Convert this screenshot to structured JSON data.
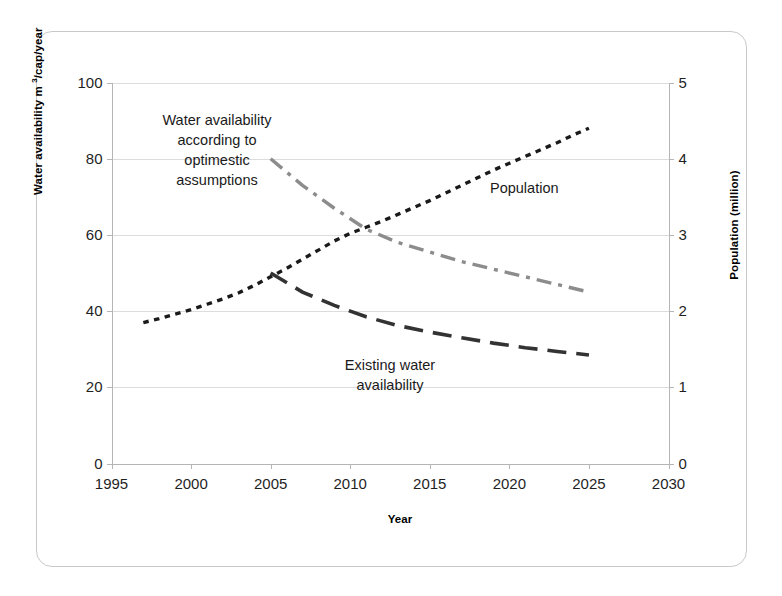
{
  "chart_data": {
    "type": "line",
    "title": "",
    "xlabel": "Year",
    "ylabel": "Water availability m 3/cap/year",
    "ylabel_main": "Water availability m",
    "ylabel_sup": "3",
    "ylabel_tail": "/cap/year",
    "y2label": "Population (million)",
    "xlim": [
      1995,
      2030
    ],
    "ylim": [
      0,
      100
    ],
    "y2lim": [
      0,
      5
    ],
    "xticks": [
      1995,
      2000,
      2005,
      2010,
      2015,
      2020,
      2025,
      2030
    ],
    "yticks": [
      0,
      20,
      40,
      60,
      80,
      100
    ],
    "y2ticks": [
      0,
      1,
      2,
      3,
      4,
      5
    ],
    "grid": true,
    "legend_position": "inline-annotations",
    "series": [
      {
        "name": "Population",
        "axis": "right",
        "unit": "million",
        "style": "fine-dotted",
        "color": "#1a1a1a",
        "x": [
          1997,
          1998,
          1999,
          2000,
          2001,
          2002,
          2003,
          2004,
          2005,
          2006,
          2007,
          2008,
          2009,
          2010,
          2011,
          2012,
          2013,
          2014,
          2015,
          2016,
          2017,
          2018,
          2019,
          2020,
          2021,
          2022,
          2023,
          2024,
          2025
        ],
        "values": [
          1.85,
          1.9,
          1.96,
          2.02,
          2.09,
          2.16,
          2.24,
          2.34,
          2.45,
          2.56,
          2.68,
          2.8,
          2.92,
          3.02,
          3.1,
          3.18,
          3.27,
          3.36,
          3.45,
          3.55,
          3.65,
          3.75,
          3.85,
          3.94,
          4.03,
          4.12,
          4.21,
          4.31,
          4.4
        ],
        "values_left_scale": [
          37,
          38,
          39.2,
          40.4,
          41.8,
          43.2,
          44.8,
          46.8,
          49,
          51.2,
          53.6,
          56,
          58.4,
          60.4,
          62,
          63.6,
          65.4,
          67.2,
          69,
          71,
          73,
          75,
          77,
          78.8,
          80.6,
          82.4,
          84.2,
          86.2,
          88
        ]
      },
      {
        "name": "Water availability according to optimestic assumptions",
        "axis": "left",
        "unit": "m3/cap/year",
        "style": "dash-dot",
        "color": "#8c8c8c",
        "x": [
          2005,
          2007,
          2009,
          2011,
          2013,
          2015,
          2017,
          2019,
          2021,
          2023,
          2025
        ],
        "values": [
          80,
          73,
          67,
          61.5,
          58,
          55.5,
          53,
          51,
          49,
          47,
          45
        ]
      },
      {
        "name": "Existing water availability",
        "axis": "left",
        "unit": "m3/cap/year",
        "style": "long-dash",
        "color": "#333333",
        "x": [
          2005,
          2007,
          2009,
          2011,
          2013,
          2015,
          2017,
          2019,
          2021,
          2023,
          2025
        ],
        "values": [
          50,
          45,
          41.5,
          38.5,
          36.2,
          34.5,
          33,
          31.6,
          30.4,
          29.4,
          28.5
        ]
      }
    ],
    "annotations": [
      {
        "id": "optimistic",
        "text": "Water availability\naccording to\noptimestic\nassumptions"
      },
      {
        "id": "existing",
        "text": "Existing water\navailability"
      },
      {
        "id": "population",
        "text": "Population"
      }
    ]
  },
  "axes": {
    "x_title": "Year",
    "y_left_title_main": "Water availability m ",
    "y_left_title_sup": "3",
    "y_left_title_tail": "/cap/year",
    "y_right_title": "Population (million)",
    "x_tick_labels": [
      "1995",
      "2000",
      "2005",
      "2010",
      "2015",
      "2020",
      "2025",
      "2030"
    ],
    "y_left_tick_labels": [
      "100",
      "80",
      "60",
      "40",
      "20",
      "0"
    ],
    "y_right_tick_labels": [
      "5",
      "4",
      "3",
      "2",
      "1",
      "0"
    ]
  },
  "colors": {
    "population": "#1a1a1a",
    "optimistic": "#8c8c8c",
    "existing": "#333333",
    "grid": "#dcdcdc",
    "axis": "#b5b5b5",
    "frame": "#c9c9c9",
    "background": "#ffffff"
  }
}
